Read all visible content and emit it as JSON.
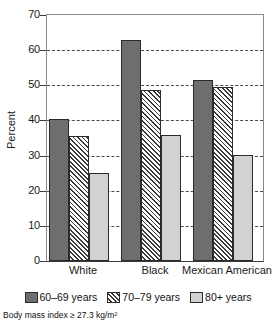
{
  "chart_data": {
    "type": "bar",
    "title": "",
    "xlabel": "",
    "ylabel": "Percent",
    "ylim": [
      0,
      70
    ],
    "yticks": [
      0,
      10,
      20,
      30,
      40,
      50,
      60,
      70
    ],
    "grid": "horizontal-dashed",
    "legend_position": "bottom",
    "categories": [
      "White",
      "Black",
      "Mexican American"
    ],
    "series": [
      {
        "name": "60–69 years",
        "values": [
          40.5,
          63.0,
          51.5
        ],
        "fill": "#6e6e6e",
        "pattern": "solid"
      },
      {
        "name": "70–79 years",
        "values": [
          35.5,
          48.7,
          49.5
        ],
        "fill": "#ffffff",
        "pattern": "diagonal-hatch"
      },
      {
        "name": "80+ years",
        "values": [
          25.0,
          36.0,
          30.2
        ],
        "fill": "#d2d2d2",
        "pattern": "solid"
      }
    ],
    "annotations": [
      "Body mass index ≥ 27.3 kg/m²"
    ]
  },
  "axis": {
    "y_title": "Percent",
    "y_ticks": [
      "0",
      "10",
      "20",
      "30",
      "40",
      "50",
      "60",
      "70"
    ],
    "x_ticks": [
      "White",
      "Black",
      "Mexican American"
    ]
  },
  "legend": {
    "items": [
      {
        "label": "60–69 years"
      },
      {
        "label": "70–79 years"
      },
      {
        "label": "80+ years"
      }
    ]
  },
  "footnote": {
    "text": "Body mass index ≥ 27.3 kg/m²"
  }
}
